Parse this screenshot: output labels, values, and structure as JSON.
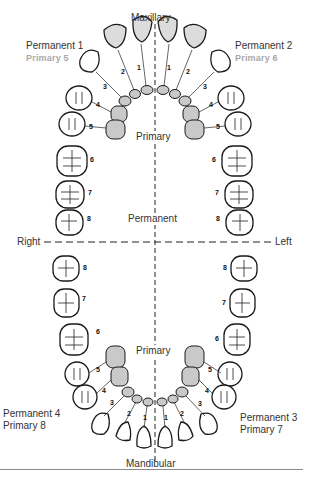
{
  "labels": {
    "top": "Maxillary",
    "bottom": "Mandibular",
    "right": "Right",
    "left": "Left",
    "primary_upper": "Primary",
    "permanent_center": "Permanent",
    "primary_lower": "Primary"
  },
  "quadrants": [
    {
      "position": "upper-left",
      "permanent": "Permanent 1",
      "primary": "Primary 5",
      "primary_faded": true
    },
    {
      "position": "upper-right",
      "permanent": "Permanent 2",
      "primary": "Primary 6",
      "primary_faded": true
    },
    {
      "position": "lower-right",
      "permanent": "Permanent 3",
      "primary": "Primary 7",
      "primary_faded": false
    },
    {
      "position": "lower-left",
      "permanent": "Permanent 4",
      "primary": "Primary 8",
      "primary_faded": false
    }
  ],
  "tooth_numbers": {
    "permanent": [
      "1",
      "2",
      "3",
      "4",
      "5",
      "6",
      "7",
      "8"
    ],
    "primary": [
      "1",
      "2",
      "3",
      "4",
      "5"
    ]
  },
  "colors": {
    "outline": "#1a1a1a",
    "tooth_fill": "#ffffff",
    "primary_fill": "#c9c9c9",
    "incisor_fill": "#d6d6d6",
    "text": "#333333",
    "faded_text": "#a8a8a8",
    "rule": "#8a8a8a"
  }
}
